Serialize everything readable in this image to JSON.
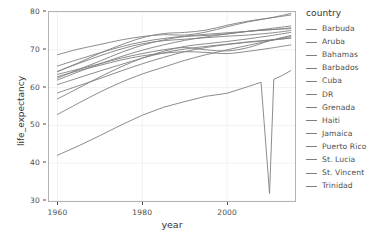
{
  "chart_data": {
    "type": "line",
    "title": "",
    "xlabel": "year",
    "ylabel": "life_expectancy",
    "xlim": [
      1958,
      2016
    ],
    "ylim": [
      30,
      80
    ],
    "xticks": [
      1960,
      1980,
      2000
    ],
    "yticks": [
      30,
      40,
      50,
      60,
      70,
      80
    ],
    "grid": true,
    "legend_title": "country",
    "legend_position": "right",
    "line_color": "#7f7f7f",
    "panel_border_color": "#b3b3b3",
    "grid_color": "#f2f2f2",
    "axis_text_color": "#4d4d4d",
    "series": [
      {
        "name": "Barbuda",
        "x": [
          1960,
          1965,
          1970,
          1975,
          1980,
          1985,
          1990,
          1995,
          2000,
          2005,
          2010,
          2015
        ],
        "values": [
          62.0,
          64.2,
          66.3,
          68.2,
          69.9,
          71.3,
          72.5,
          73.4,
          74.2,
          74.9,
          75.6,
          76.3
        ]
      },
      {
        "name": "Aruba",
        "x": [
          1960,
          1965,
          1970,
          1975,
          1980,
          1985,
          1990,
          1995,
          2000,
          2005,
          2010,
          2015
        ],
        "values": [
          65.7,
          67.5,
          69.2,
          70.8,
          72.1,
          73.0,
          73.6,
          74.1,
          74.5,
          74.9,
          75.3,
          75.8
        ]
      },
      {
        "name": "Bahamas",
        "x": [
          1960,
          1965,
          1970,
          1975,
          1980,
          1985,
          1990,
          1995,
          2000,
          2005,
          2010,
          2015
        ],
        "values": [
          63.5,
          64.9,
          66.3,
          67.8,
          69.0,
          70.0,
          70.6,
          70.0,
          69.7,
          70.6,
          72.4,
          73.8
        ]
      },
      {
        "name": "Barbados",
        "x": [
          1960,
          1965,
          1970,
          1975,
          1980,
          1985,
          1990,
          1995,
          2000,
          2005,
          2010,
          2015
        ],
        "values": [
          62.5,
          64.8,
          67.0,
          69.3,
          71.2,
          72.6,
          73.5,
          73.8,
          74.2,
          74.9,
          75.3,
          75.6
        ]
      },
      {
        "name": "Cuba",
        "x": [
          1960,
          1965,
          1970,
          1975,
          1980,
          1985,
          1990,
          1995,
          2000,
          2005,
          2010,
          2015
        ],
        "values": [
          64.2,
          66.6,
          69.1,
          71.3,
          73.2,
          74.3,
          74.6,
          75.2,
          76.5,
          77.6,
          78.4,
          79.2
        ]
      },
      {
        "name": "DR",
        "x": [
          1960,
          1965,
          1970,
          1975,
          1980,
          1985,
          1990,
          1995,
          2000,
          2005,
          2010,
          2015
        ],
        "values": [
          52.9,
          55.9,
          58.8,
          61.4,
          63.6,
          65.4,
          67.2,
          68.7,
          70.0,
          71.2,
          72.4,
          73.5
        ]
      },
      {
        "name": "Grenada",
        "x": [
          1960,
          1965,
          1970,
          1975,
          1980,
          1985,
          1990,
          1995,
          2000,
          2005,
          2010,
          2015
        ],
        "values": [
          58.6,
          60.5,
          62.4,
          64.4,
          66.3,
          68.0,
          69.5,
          70.6,
          71.4,
          72.0,
          72.5,
          73.1
        ]
      },
      {
        "name": "Haiti",
        "x": [
          1960,
          1965,
          1970,
          1975,
          1980,
          1985,
          1990,
          1995,
          2000,
          2005,
          2008,
          2010,
          2011,
          2013,
          2015
        ],
        "values": [
          42.1,
          44.6,
          47.3,
          50.1,
          52.7,
          54.8,
          56.3,
          57.7,
          58.5,
          60.3,
          61.4,
          32.0,
          62.2,
          63.2,
          64.5
        ]
      },
      {
        "name": "Jamaica",
        "x": [
          1960,
          1965,
          1970,
          1975,
          1980,
          1985,
          1990,
          1995,
          2000,
          2005,
          2010,
          2015
        ],
        "values": [
          64.3,
          66.4,
          68.4,
          70.2,
          71.6,
          72.4,
          72.8,
          73.2,
          73.6,
          73.9,
          74.4,
          75.1
        ]
      },
      {
        "name": "Puerto Rico",
        "x": [
          1960,
          1965,
          1970,
          1975,
          1980,
          1985,
          1990,
          1995,
          2000,
          2005,
          2010,
          2015
        ],
        "values": [
          68.7,
          70.2,
          71.4,
          72.6,
          73.5,
          74.0,
          73.9,
          74.7,
          76.1,
          77.4,
          78.4,
          79.6
        ]
      },
      {
        "name": "St. Lucia",
        "x": [
          1960,
          1965,
          1970,
          1975,
          1980,
          1985,
          1990,
          1995,
          2000,
          2005,
          2010,
          2015
        ],
        "values": [
          57.0,
          59.9,
          62.8,
          65.5,
          67.8,
          69.6,
          70.9,
          71.6,
          72.2,
          72.9,
          73.7,
          74.6
        ]
      },
      {
        "name": "St. Vincent",
        "x": [
          1960,
          1965,
          1970,
          1975,
          1980,
          1985,
          1990,
          1995,
          2000,
          2005,
          2010,
          2015
        ],
        "values": [
          60.8,
          62.6,
          64.4,
          66.1,
          67.8,
          69.2,
          70.2,
          70.9,
          71.5,
          72.1,
          72.6,
          73.1
        ]
      },
      {
        "name": "Trinidad",
        "x": [
          1960,
          1965,
          1970,
          1975,
          1980,
          1985,
          1990,
          1995,
          2000,
          2005,
          2010,
          2015
        ],
        "values": [
          62.9,
          64.5,
          65.9,
          67.3,
          68.4,
          69.1,
          69.5,
          69.3,
          69.0,
          69.6,
          70.4,
          71.3
        ]
      }
    ]
  },
  "axes": {
    "y_title": "life_expectancy",
    "x_title": "year",
    "y_tick_labels": [
      "80",
      "70",
      "60",
      "50",
      "40",
      "30"
    ],
    "x_tick_labels": [
      "1960",
      "1980",
      "2000"
    ]
  },
  "legend": {
    "title": "country",
    "items": [
      {
        "label": "Barbuda"
      },
      {
        "label": "Aruba"
      },
      {
        "label": "Bahamas"
      },
      {
        "label": "Barbados"
      },
      {
        "label": "Cuba"
      },
      {
        "label": "DR"
      },
      {
        "label": "Grenada"
      },
      {
        "label": "Haiti"
      },
      {
        "label": "Jamaica"
      },
      {
        "label": "Puerto Rico"
      },
      {
        "label": "St. Lucia"
      },
      {
        "label": "St. Vincent"
      },
      {
        "label": "Trinidad"
      }
    ]
  }
}
